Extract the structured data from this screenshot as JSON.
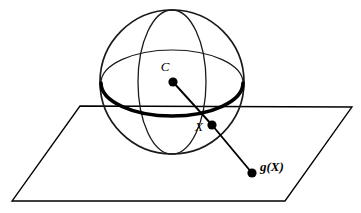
{
  "figure": {
    "background_color": "#ffffff",
    "stroke_color": "#000000",
    "width": 361,
    "height": 213
  },
  "labels": {
    "center_label": "C",
    "sphere_point_label": "X",
    "projected_point_label": "g(X)"
  },
  "geometry": {
    "sphere": {
      "center_x": 172,
      "center_y": 82,
      "radius": 72,
      "outline_width": 1.6
    },
    "equator": {
      "center_x": 172,
      "center_y": 83,
      "rx": 71,
      "ry": 33,
      "front_arc_width": 3.4,
      "back_arc_width": 1.2
    },
    "meridian": {
      "center_x": 172,
      "center_y": 82,
      "rx": 34,
      "ry": 72,
      "stroke_width": 1.3
    },
    "plane": {
      "top_left_x": 80,
      "top_left_y": 106,
      "top_right_x": 352,
      "top_right_y": 107,
      "bottom_right_x": 285,
      "bottom_right_y": 201,
      "bottom_left_x": 12,
      "bottom_left_y": 201,
      "stroke_width": 1.3
    },
    "points": {
      "center": {
        "x": 173,
        "y": 82,
        "r": 4.6
      },
      "sphere_point": {
        "x": 212,
        "y": 125,
        "r": 4.6
      },
      "projected_point": {
        "x": 252,
        "y": 173,
        "r": 4.6
      }
    },
    "ray": {
      "stroke_width": 1.9,
      "from_x": 173,
      "from_y": 82,
      "via_x": 212,
      "via_y": 125,
      "to_x": 252,
      "to_y": 173
    },
    "label_positions": {
      "center": {
        "x": 165,
        "y": 71
      },
      "sphere_point": {
        "x": 194,
        "y": 131
      },
      "projected_point": {
        "x": 260,
        "y": 171
      }
    }
  }
}
